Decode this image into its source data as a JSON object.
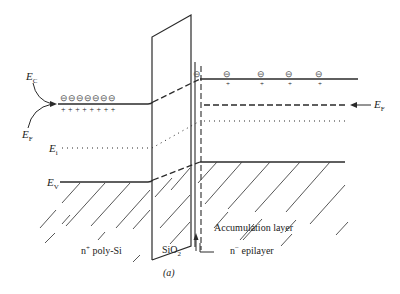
{
  "labels": {
    "ec": "E",
    "ec_sub": "C",
    "ef_left": "E",
    "ef_left_sub": "F",
    "ei": "E",
    "ei_sub": "i",
    "ev": "E",
    "ev_sub": "V",
    "ef_right": "E",
    "ef_right_sub": "F",
    "accumulation": "Accumulation layer",
    "region_left": "n",
    "region_left_sup": "+",
    "region_left_rest": " poly-Si",
    "oxide": "SiO",
    "oxide_sub": "2",
    "region_right": "n",
    "region_right_sup": "−",
    "region_right_rest": " epilayer",
    "caption": "(a)"
  },
  "charges": {
    "left_electrons": "⊖⊖⊖⊖⊖⊖⊖",
    "left_holes": "+ + + + + + + +",
    "right_electron": "⊖",
    "right_plus": "+"
  },
  "colors": {
    "line": "#2a2a2a",
    "hatch": "#444444"
  }
}
